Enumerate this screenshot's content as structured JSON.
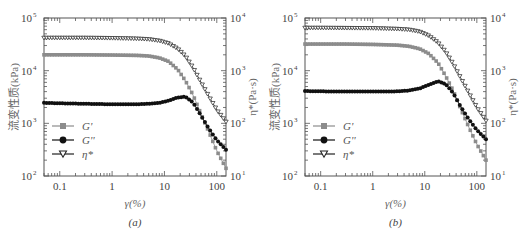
{
  "chart_data": [
    {
      "type": "line",
      "caption": "(a)",
      "xlabel": "γ(%)",
      "ylabel_left": "流变性质(kPa)",
      "ylabel_right": "η*(Pa·s)",
      "xscale": "log",
      "yscale": "log",
      "xlim": [
        0.05,
        150
      ],
      "ylim_left": [
        100,
        100000
      ],
      "ylim_right": [
        10,
        10000
      ],
      "x_ticks": [
        "0.1",
        "1",
        "10",
        "100"
      ],
      "y_ticks_left": [
        "10^2",
        "10^3",
        "10^4",
        "10^5"
      ],
      "y_ticks_right": [
        "10^1",
        "10^2",
        "10^3",
        "10^4"
      ],
      "grid": false,
      "legend": {
        "position": "lower-left",
        "entries": [
          "G'",
          "G''",
          "η*"
        ]
      },
      "series": [
        {
          "name": "G'",
          "axis": "left",
          "marker": "square",
          "color": "#8c8c8c",
          "x": [
            0.05,
            0.1,
            0.3,
            1,
            3,
            5,
            8,
            12,
            18,
            25,
            35,
            50,
            70,
            100,
            150
          ],
          "values": [
            20000,
            20000,
            20000,
            19800,
            19500,
            19000,
            17500,
            15000,
            10500,
            6500,
            3500,
            1500,
            700,
            300,
            140
          ]
        },
        {
          "name": "G''",
          "axis": "left",
          "marker": "circle",
          "color": "#111111",
          "x": [
            0.05,
            0.1,
            0.3,
            1,
            3,
            5,
            8,
            12,
            18,
            25,
            35,
            50,
            70,
            100,
            150
          ],
          "values": [
            2450,
            2400,
            2350,
            2300,
            2300,
            2350,
            2450,
            2700,
            3100,
            3200,
            2500,
            1400,
            800,
            480,
            315
          ]
        },
        {
          "name": "η*",
          "axis": "right",
          "marker": "triangle-down-open",
          "color": "#222222",
          "x": [
            0.05,
            0.1,
            0.3,
            1,
            3,
            5,
            8,
            12,
            18,
            25,
            35,
            50,
            70,
            100,
            150
          ],
          "values": [
            4200,
            4200,
            4200,
            4150,
            4050,
            3950,
            3700,
            3300,
            2600,
            1900,
            1150,
            600,
            330,
            180,
            107
          ]
        }
      ]
    },
    {
      "type": "line",
      "caption": "(b)",
      "xlabel": "γ(%)",
      "ylabel_left": "流变性质(kPa)",
      "ylabel_right": "η*(Pa·s)",
      "xscale": "log",
      "yscale": "log",
      "xlim": [
        0.05,
        150
      ],
      "ylim_left": [
        100,
        100000
      ],
      "ylim_right": [
        10,
        10000
      ],
      "x_ticks": [
        "0.1",
        "1",
        "10",
        "100"
      ],
      "y_ticks_left": [
        "10^2",
        "10^3",
        "10^4",
        "10^5"
      ],
      "y_ticks_right": [
        "10^1",
        "10^2",
        "10^3",
        "10^4"
      ],
      "grid": false,
      "legend": {
        "position": "lower-left",
        "entries": [
          "G'",
          "G''",
          "η*"
        ]
      },
      "series": [
        {
          "name": "G'",
          "axis": "left",
          "marker": "square",
          "color": "#8c8c8c",
          "x": [
            0.05,
            0.1,
            0.3,
            1,
            3,
            5,
            8,
            12,
            18,
            25,
            35,
            50,
            70,
            100,
            150
          ],
          "values": [
            32000,
            32000,
            32000,
            31500,
            30500,
            29000,
            26000,
            21000,
            14000,
            8000,
            4200,
            1800,
            850,
            400,
            200
          ]
        },
        {
          "name": "G''",
          "axis": "left",
          "marker": "circle",
          "color": "#111111",
          "x": [
            0.05,
            0.1,
            0.3,
            1,
            3,
            5,
            8,
            12,
            18,
            25,
            35,
            50,
            70,
            100,
            150
          ],
          "values": [
            4100,
            4050,
            4000,
            4000,
            4050,
            4200,
            4600,
            5400,
            6300,
            5600,
            3800,
            2000,
            1200,
            750,
            500
          ]
        },
        {
          "name": "η*",
          "axis": "right",
          "marker": "triangle-down-open",
          "color": "#222222",
          "x": [
            0.05,
            0.1,
            0.3,
            1,
            3,
            5,
            8,
            12,
            18,
            25,
            35,
            50,
            70,
            100,
            150
          ],
          "values": [
            6500,
            6500,
            6450,
            6400,
            6200,
            6000,
            5500,
            4600,
            3400,
            2300,
            1350,
            700,
            380,
            200,
            112
          ]
        }
      ]
    }
  ],
  "panels": [
    {
      "caption": "(a)",
      "xlabel": "γ(%)",
      "ylabel_left": "流变性质(kPa)",
      "ylabel_right": "η*(Pa·s)"
    },
    {
      "caption": "(b)",
      "xlabel": "γ(%)",
      "ylabel_left": "流变性质(kPa)",
      "ylabel_right": "η*(Pa·s)"
    }
  ]
}
